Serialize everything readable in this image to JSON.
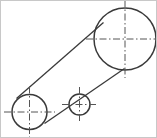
{
  "drawing": {
    "title": "Belt drive pulley arrangement",
    "type": "technical-line-drawing",
    "background_color": "#ffffff",
    "border_color": "#c8c8c8",
    "outline_color": "#3a3a3a",
    "centerline_color": "#555555",
    "canvas": {
      "width": 157,
      "height": 138
    },
    "pulleys": [
      {
        "name": "large-pulley",
        "label": "large driven pulley",
        "cx": 124,
        "cy": 38,
        "r": 31,
        "centerline_overhang": 8
      },
      {
        "name": "small-pulley",
        "label": "idler pulley",
        "cx": 78.5,
        "cy": 103.5,
        "r": 10.5,
        "centerline_overhang": 7
      },
      {
        "name": "left-pulley",
        "label": "drive pulley",
        "cx": 28.5,
        "cy": 111,
        "r": 17.5,
        "centerline_overhang": 8
      }
    ],
    "belts": [
      {
        "name": "upper-belt-span",
        "label": "upper belt span",
        "x1": 15.5,
        "y1": 97.5,
        "x2": 102.5,
        "y2": 21.5
      },
      {
        "name": "lower-belt-span",
        "label": "lower belt span",
        "x1": 123.5,
        "y1": 67.5,
        "x2": 43.5,
        "y2": 122.5
      }
    ]
  }
}
